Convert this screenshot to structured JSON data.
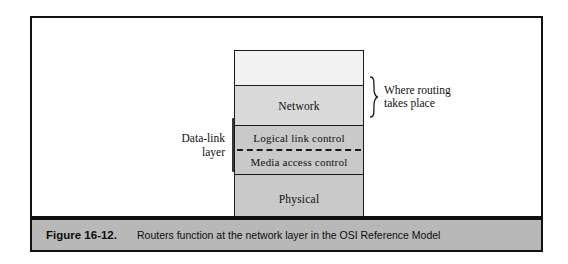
{
  "figure": {
    "caption_label": "Figure 16-12.",
    "caption_text": "Routers function at the network layer in the OSI Reference Model",
    "caption_bar_color": "#b8b8b8",
    "frame_color": "#111111"
  },
  "diagram": {
    "type": "stacked-layer-diagram",
    "layers": [
      {
        "name": "upper-layers",
        "label": "",
        "fill": "#f2f2f2"
      },
      {
        "name": "network",
        "label": "Network",
        "fill": "#d9d9d9"
      },
      {
        "name": "data-link",
        "label": "",
        "fill": "#c9c9c9",
        "sublayers": [
          {
            "name": "logical-link-control",
            "label": "Logical link control"
          },
          {
            "name": "media-access-control",
            "label": "Media access control"
          }
        ]
      },
      {
        "name": "physical",
        "label": "Physical",
        "fill": "#c9c9c9"
      }
    ],
    "annotations": [
      {
        "name": "routing-annotation",
        "text_line_1": "Where routing",
        "text_line_2": "takes place",
        "marker": "right-curly-brace",
        "targets": [
          "network"
        ],
        "side": "right"
      },
      {
        "name": "data-link-annotation",
        "text_line_1": "Data-link",
        "text_line_2": "layer",
        "marker": "left-square-bracket",
        "targets": [
          "logical-link-control",
          "media-access-control"
        ],
        "side": "left"
      }
    ]
  }
}
